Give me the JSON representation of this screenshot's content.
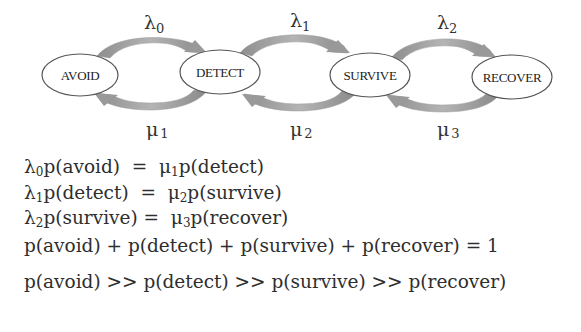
{
  "diagram": {
    "states": [
      {
        "id": "avoid",
        "label": "AVOID",
        "cx": 80,
        "cy": 75,
        "rx": 38,
        "ry": 21
      },
      {
        "id": "detect",
        "label": "DETECT",
        "cx": 220,
        "cy": 72,
        "rx": 40,
        "ry": 22
      },
      {
        "id": "survive",
        "label": "SURVIVE",
        "cx": 370,
        "cy": 75,
        "rx": 40,
        "ry": 22
      },
      {
        "id": "recover",
        "label": "RECOVER",
        "cx": 512,
        "cy": 77,
        "rx": 40,
        "ry": 22
      }
    ],
    "forward_rates": [
      {
        "symbol": "λ",
        "sub": "0",
        "from": "avoid",
        "to": "detect"
      },
      {
        "symbol": "λ",
        "sub": "1",
        "from": "detect",
        "to": "survive"
      },
      {
        "symbol": "λ",
        "sub": "2",
        "from": "survive",
        "to": "recover"
      }
    ],
    "backward_rates": [
      {
        "symbol": "μ",
        "sub": "1",
        "from": "detect",
        "to": "avoid"
      },
      {
        "symbol": "μ",
        "sub": "2",
        "from": "survive",
        "to": "detect"
      },
      {
        "symbol": "μ",
        "sub": "3",
        "from": "recover",
        "to": "survive"
      }
    ],
    "arrow_color": "#a0a0a0",
    "ellipse_stroke": "#555555"
  },
  "equations": [
    {
      "lhs_sym": "λ",
      "lhs_sub": "0",
      "lhs_rest": "p(avoid)",
      "op": "  =  ",
      "rhs_sym": "μ",
      "rhs_sub": "1",
      "rhs_rest": "p(detect)"
    },
    {
      "lhs_sym": "λ",
      "lhs_sub": "1",
      "lhs_rest": "p(detect)",
      "op": "  =  ",
      "rhs_sym": "μ",
      "rhs_sub": "2",
      "rhs_rest": "p(survive)"
    },
    {
      "lhs_sym": "λ",
      "lhs_sub": "2",
      "lhs_rest": "p(survive)",
      "op": " =  ",
      "rhs_sym": "μ",
      "rhs_sub": "3",
      "rhs_rest": "p(recover)"
    }
  ],
  "normalization": "p(avoid) + p(detect) + p(survive) + p(recover) = 1",
  "ordering": "p(avoid) >> p(detect) >> p(survive) >> p(recover)"
}
